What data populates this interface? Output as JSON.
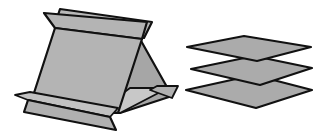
{
  "figure": {
    "description": "Folded tent-shaped surface beside a stack of three parallel planes",
    "colors": {
      "background": "#ffffff",
      "stroke": "#111111",
      "face_front": "#b4b4b4",
      "face_back": "#a6a6a6",
      "face_light": "#c8c8c8",
      "plane_fill": "#ababab"
    },
    "tent": {
      "label": "folded-tent-surface"
    },
    "planes": {
      "label": "stacked-parallel-planes",
      "count": 3
    }
  }
}
